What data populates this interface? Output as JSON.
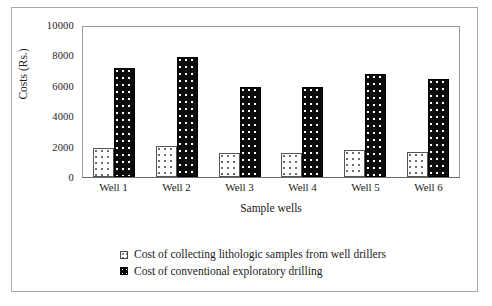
{
  "chart_data": {
    "type": "bar",
    "title": "",
    "xlabel": "Sample wells",
    "ylabel": "Costs (Rs.)",
    "ylim": [
      0,
      10000
    ],
    "yticks": [
      10000,
      8000,
      6000,
      4000,
      2000,
      0
    ],
    "ytick_labels": [
      "10000",
      "8000",
      "6000",
      "4000",
      "2000",
      "0"
    ],
    "grid": false,
    "legend_position": "bottom",
    "categories": [
      "Well 1",
      "Well 2",
      "Well 3",
      "Well 4",
      "Well 5",
      "Well 6"
    ],
    "series": [
      {
        "name": "Cost of collecting lithologic samples from well drillers",
        "swatch": "light-dotted",
        "values": [
          1950,
          2100,
          1600,
          1600,
          1800,
          1650
        ]
      },
      {
        "name": "Cost of conventional exploratory drilling",
        "swatch": "dark-dotted",
        "values": [
          7300,
          8000,
          6000,
          6000,
          6900,
          6550
        ]
      }
    ]
  },
  "axes": {
    "y_title": "Costs (Rs.)",
    "x_title": "Sample wells",
    "y_labels": [
      "10000",
      "8000",
      "6000",
      "4000",
      "2000",
      "0"
    ],
    "x_labels": [
      "Well 1",
      "Well 2",
      "Well 3",
      "Well 4",
      "Well 5",
      "Well 6"
    ]
  },
  "legend": {
    "entries": [
      {
        "label": "Cost of collecting lithologic samples from well drillers"
      },
      {
        "label": "Cost of conventional exploratory drilling"
      }
    ]
  },
  "colors": {
    "series_light_fill": "#ffffff",
    "series_light_dot": "#6e6e6e",
    "series_light_edge": "#555555",
    "series_dark_fill": "#0b0b0b",
    "series_dark_dot": "#ffffff",
    "series_dark_edge": "#000000",
    "frame": "#a8a8a8",
    "plot_border": "#9a9a9a",
    "text": "#1a1a1a",
    "background": "#ffffff"
  }
}
